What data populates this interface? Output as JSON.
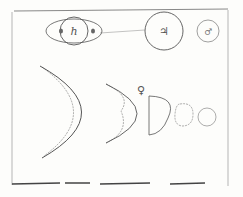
{
  "figure": {
    "title": "",
    "ink_color": "#555555",
    "paper_color": "#fdfdfb",
    "planets": [
      {
        "name": "Saturn",
        "symbol": "h"
      },
      {
        "name": "Jupiter",
        "symbol": "♃"
      },
      {
        "name": "Mars",
        "symbol": "♂"
      }
    ],
    "venus": {
      "symbol": "♀",
      "phases": [
        "large crescent",
        "crescent",
        "half",
        "gibbous",
        "full"
      ]
    }
  }
}
